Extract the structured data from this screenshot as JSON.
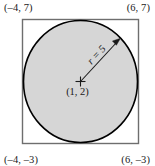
{
  "figure": {
    "type": "geometry-diagram",
    "colors": {
      "circle_fill": "#d6d6d6",
      "circle_stroke": "#000000",
      "square_stroke": "#6e6e6e",
      "text": "#1a1a1a",
      "background": "#ffffff"
    },
    "square": {
      "corners": {
        "top_left": "(–4, 7)",
        "top_right": "(6, 7)",
        "bottom_left": "(–4, –3)",
        "bottom_right": "(6, –3)"
      }
    },
    "circle": {
      "center_label": "(1, 2)",
      "radius_label": "r = 5"
    }
  }
}
